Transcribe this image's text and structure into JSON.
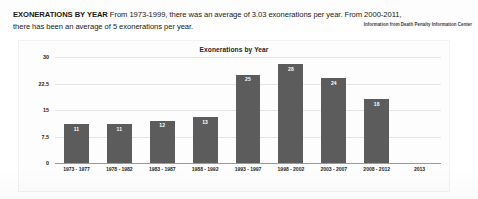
{
  "article": {
    "kicker": "EXONERATIONS BY YEAR",
    "body_line_1": "From 1973-1999, there was an average of 3.03 exonerations per year. From 2000-2011,",
    "body_line_2": "there has been an average of 5 exonerations per year.",
    "source_credit": "Information from Death Penalty Information Center"
  },
  "chart_data": {
    "type": "bar",
    "title": "Exonerations by Year",
    "xlabel": "",
    "ylabel": "",
    "categories": [
      "1973 - 1977",
      "1978 - 1982",
      "1983 - 1987",
      "1988 - 1992",
      "1993 - 1997",
      "1998 - 2002",
      "2003 - 2007",
      "2008 - 2012",
      "2013"
    ],
    "values": [
      11,
      11,
      12,
      13,
      25,
      28,
      24,
      18,
      null
    ],
    "value_labels": [
      "11",
      "11",
      "12",
      "13",
      "25",
      "28",
      "24",
      "18",
      ""
    ],
    "ylim": [
      0,
      30
    ],
    "yticks": [
      "0",
      "7.5",
      "15",
      "22.5",
      "30"
    ],
    "ytick_values": [
      0,
      7.5,
      15,
      22.5,
      30
    ],
    "grid": true,
    "legend": false,
    "bar_color": "#5c5c5c",
    "grid_color": "#e4e4e4",
    "axis_color": "#9a9a9a"
  }
}
